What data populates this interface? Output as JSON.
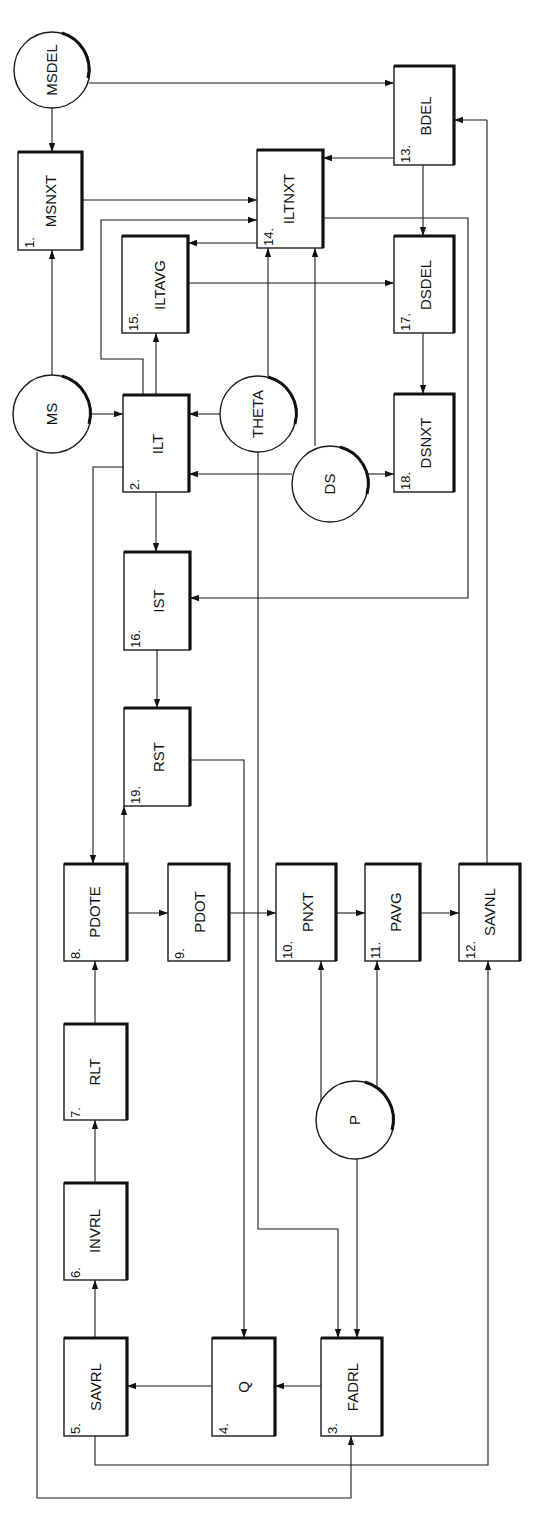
{
  "diagram": {
    "orientation": "rotated-90-ccw",
    "nodes": {
      "msdel": {
        "label": "MSDEL",
        "kind": "circle"
      },
      "ms": {
        "label": "MS",
        "kind": "circle"
      },
      "theta": {
        "label": "THETA",
        "kind": "circle"
      },
      "ds": {
        "label": "DS",
        "kind": "circle"
      },
      "p": {
        "label": "P",
        "kind": "circle"
      },
      "b1": {
        "num": "1.",
        "label": "MSNXT"
      },
      "b2": {
        "num": "2.",
        "label": "ILT"
      },
      "b3": {
        "num": "3.",
        "label": "FADRL"
      },
      "b4": {
        "num": "4.",
        "label": "Q"
      },
      "b5": {
        "num": "5.",
        "label": "SAVRL"
      },
      "b6": {
        "num": "6.",
        "label": "INVRL"
      },
      "b7": {
        "num": "7.",
        "label": "RLT"
      },
      "b8": {
        "num": "8.",
        "label": "PDOTE"
      },
      "b9": {
        "num": "9.",
        "label": "PDOT"
      },
      "b10": {
        "num": "10.",
        "label": "PNXT"
      },
      "b11": {
        "num": "11.",
        "label": "PAVG"
      },
      "b12": {
        "num": "12.",
        "label": "SAVNL"
      },
      "b13": {
        "num": "13.",
        "label": "BDEL"
      },
      "b14": {
        "num": "14.",
        "label": "ILTNXT"
      },
      "b15": {
        "num": "15.",
        "label": "ILTAVG"
      },
      "b16": {
        "num": "16.",
        "label": "IST"
      },
      "b17": {
        "num": "17.",
        "label": "DSDEL"
      },
      "b18": {
        "num": "18.",
        "label": "DSNXT"
      },
      "b19": {
        "num": "19.",
        "label": "RST"
      }
    },
    "edges": [
      {
        "from": "MSDEL",
        "to": "MSNXT"
      },
      {
        "from": "MSDEL",
        "to": "BDEL"
      },
      {
        "from": "MS",
        "to": "MSNXT"
      },
      {
        "from": "MS",
        "to": "ILT"
      },
      {
        "from": "MS",
        "to": "FADRL"
      },
      {
        "from": "MSNXT",
        "to": "ILTNXT"
      },
      {
        "from": "ILT",
        "to": "ILTNXT"
      },
      {
        "from": "ILT",
        "to": "ILTAVG"
      },
      {
        "from": "ILT",
        "to": "IST"
      },
      {
        "from": "ILT",
        "to": "PDOTE"
      },
      {
        "from": "ILTNXT",
        "to": "ILTAVG"
      },
      {
        "from": "ILTNXT",
        "to": "IST"
      },
      {
        "from": "BDEL",
        "to": "ILTNXT"
      },
      {
        "from": "BDEL",
        "to": "DSDEL"
      },
      {
        "from": "ILTAVG",
        "to": "DSDEL"
      },
      {
        "from": "DSDEL",
        "to": "DSNXT"
      },
      {
        "from": "THETA",
        "to": "ILT"
      },
      {
        "from": "THETA",
        "to": "ILTNXT"
      },
      {
        "from": "THETA",
        "to": "FADRL"
      },
      {
        "from": "DS",
        "to": "ILT"
      },
      {
        "from": "DS",
        "to": "ILTNXT"
      },
      {
        "from": "DS",
        "to": "DSNXT"
      },
      {
        "from": "IST",
        "to": "RST"
      },
      {
        "from": "RST",
        "to": "Q"
      },
      {
        "from": "PDOTE",
        "to": "RST"
      },
      {
        "from": "PDOTE",
        "to": "PDOT"
      },
      {
        "from": "PDOT",
        "to": "PNXT"
      },
      {
        "from": "PNXT",
        "to": "PAVG"
      },
      {
        "from": "PAVG",
        "to": "SAVNL"
      },
      {
        "from": "SAVNL",
        "to": "BDEL"
      },
      {
        "from": "P",
        "to": "PNXT"
      },
      {
        "from": "P",
        "to": "PAVG"
      },
      {
        "from": "P",
        "to": "FADRL"
      },
      {
        "from": "RLT",
        "to": "PDOTE"
      },
      {
        "from": "INVRL",
        "to": "RLT"
      },
      {
        "from": "SAVRL",
        "to": "INVRL"
      },
      {
        "from": "SAVRL",
        "to": "SAVNL"
      },
      {
        "from": "Q",
        "to": "SAVRL"
      },
      {
        "from": "FADRL",
        "to": "Q"
      }
    ]
  }
}
